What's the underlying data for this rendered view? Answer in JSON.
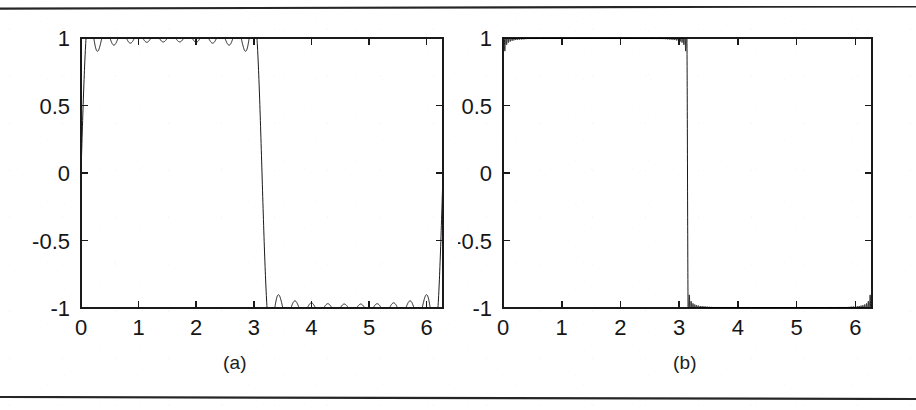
{
  "figure": {
    "panels": [
      {
        "id": "a",
        "caption": "(a)",
        "x_tick_labels": [
          "0",
          "1",
          "2",
          "3",
          "4",
          "5",
          "6"
        ],
        "y_tick_labels": [
          "1",
          "0.5",
          "0",
          "-0.5",
          "-1"
        ]
      },
      {
        "id": "b",
        "caption": "(b)",
        "x_tick_labels": [
          "0",
          "1",
          "2",
          "3",
          "4",
          "5",
          "6"
        ],
        "y_tick_labels": [
          "1",
          "0.5",
          "0",
          "-0.5",
          "-1"
        ]
      }
    ]
  },
  "chart_data": [
    {
      "type": "line",
      "panel": "a",
      "title": "",
      "subtitle": "",
      "xlabel": "",
      "ylabel": "",
      "caption": "(a)",
      "xlim": [
        0,
        6.283185307179586
      ],
      "ylim": [
        -1,
        1
      ],
      "x_ticks": [
        0,
        1,
        2,
        3,
        4,
        5,
        6
      ],
      "x_tick_labels": [
        "0",
        "1",
        "2",
        "3",
        "4",
        "5",
        "6"
      ],
      "y_ticks": [
        1,
        0.5,
        0,
        -0.5,
        -1
      ],
      "y_tick_labels": [
        "1",
        "0.5",
        "0",
        "-0.5",
        "-1"
      ],
      "grid": false,
      "legend": null,
      "line_color": "#1a1a1a",
      "line_width": 1,
      "series": [
        {
          "name": "Fourier partial sum of square wave (21 terms)",
          "function": "square_wave_partial_sum",
          "harmonics": 21,
          "description": "Sum over odd k of (4/pi)*sin(k*x)/k for k = 1,3,5,...,21",
          "num_points": 2000,
          "overshoot_peak": 0.94,
          "plateau_level": 0.79,
          "discontinuity_x": 3.141592653589793
        }
      ]
    },
    {
      "type": "line",
      "panel": "b",
      "title": "",
      "subtitle": "",
      "xlabel": "",
      "ylabel": "",
      "caption": "(b)",
      "xlim": [
        0,
        6.283185307179586
      ],
      "ylim": [
        -1,
        1
      ],
      "x_ticks": [
        0,
        1,
        2,
        3,
        4,
        5,
        6
      ],
      "x_tick_labels": [
        "0",
        "1",
        "2",
        "3",
        "4",
        "5",
        "6"
      ],
      "y_ticks": [
        1,
        0.5,
        0,
        -0.5,
        -1
      ],
      "y_tick_labels": [
        "1",
        "0.5",
        "0",
        "-0.5",
        "-1"
      ],
      "grid": false,
      "legend": null,
      "line_color": "#1a1a1a",
      "line_width": 1,
      "series": [
        {
          "name": "Fourier partial sum of square wave (201 terms)",
          "function": "square_wave_partial_sum",
          "harmonics": 201,
          "description": "Sum over odd k of (4/pi)*sin(k*x)/k for k = 1,3,5,...,201",
          "num_points": 12000,
          "overshoot_peak": 0.94,
          "plateau_level": 0.79,
          "discontinuity_x": 3.141592653589793
        }
      ]
    }
  ]
}
